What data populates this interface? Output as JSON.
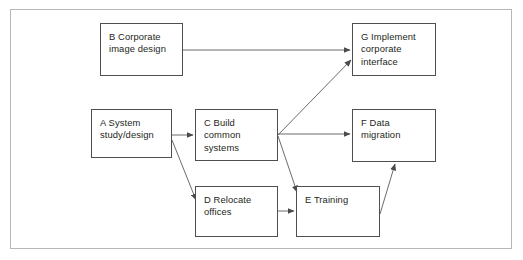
{
  "diagram": {
    "frame": {
      "visible": true,
      "border_color": "#b7b7b7"
    },
    "node_border_color": "#4f4f4f",
    "edge_color": "#5a5a5a",
    "text_color": "#231f20",
    "nodes": [
      {
        "id": "B",
        "name": "node-b-corporate-image-design",
        "label": "B   Corporate\nimage design",
        "code": "B",
        "text": "Corporate image design",
        "x": 100,
        "y": 23,
        "w": 83,
        "h": 53
      },
      {
        "id": "G",
        "name": "node-g-implement-corporate-interface",
        "label": "G   Implement\ncorporate\ninterface",
        "code": "G",
        "text": "Implement corporate interface",
        "x": 352,
        "y": 23,
        "w": 84,
        "h": 53
      },
      {
        "id": "A",
        "name": "node-a-system-study-design",
        "label": "A   System\nstudy/design",
        "code": "A",
        "text": "System study/design",
        "x": 91,
        "y": 109,
        "w": 81,
        "h": 49
      },
      {
        "id": "C",
        "name": "node-c-build-common-systems",
        "label": "C   Build\ncommon\nsystems",
        "code": "C",
        "text": "Build common systems",
        "x": 195,
        "y": 109,
        "w": 83,
        "h": 52
      },
      {
        "id": "F",
        "name": "node-f-data-migration",
        "label": "F   Data\nmigration",
        "code": "F",
        "text": "Data migration",
        "x": 352,
        "y": 109,
        "w": 84,
        "h": 53
      },
      {
        "id": "D",
        "name": "node-d-relocate-offices",
        "label": "D   Relocate\noffices",
        "code": "D",
        "text": "Relocate offices",
        "x": 195,
        "y": 186,
        "w": 83,
        "h": 51
      },
      {
        "id": "E",
        "name": "node-e-training",
        "label": "E   Training",
        "code": "E",
        "text": "Training",
        "x": 296,
        "y": 186,
        "w": 84,
        "h": 51
      }
    ],
    "edges": [
      {
        "name": "edge-b-to-g",
        "from": "B",
        "to": "G",
        "x1": 183,
        "y1": 50,
        "x2": 350,
        "y2": 50
      },
      {
        "name": "edge-a-to-c",
        "from": "A",
        "to": "C",
        "x1": 172,
        "y1": 135,
        "x2": 193,
        "y2": 135
      },
      {
        "name": "edge-a-to-d",
        "from": "A",
        "to": "D",
        "x1": 172,
        "y1": 140,
        "x2": 196,
        "y2": 200
      },
      {
        "name": "edge-c-to-g",
        "from": "C",
        "to": "G",
        "x1": 278,
        "y1": 135,
        "x2": 351,
        "y2": 60
      },
      {
        "name": "edge-c-to-f",
        "from": "C",
        "to": "F",
        "x1": 278,
        "y1": 134,
        "x2": 350,
        "y2": 134
      },
      {
        "name": "edge-c-to-e",
        "from": "C",
        "to": "E",
        "x1": 278,
        "y1": 136,
        "x2": 297,
        "y2": 192
      },
      {
        "name": "edge-d-to-e",
        "from": "D",
        "to": "E",
        "x1": 278,
        "y1": 211,
        "x2": 294,
        "y2": 211
      },
      {
        "name": "edge-e-to-f",
        "from": "E",
        "to": "F",
        "x1": 380,
        "y1": 214,
        "x2": 395,
        "y2": 164
      }
    ]
  }
}
